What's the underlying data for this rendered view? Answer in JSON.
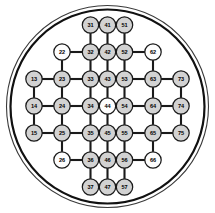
{
  "figure": {
    "type": "node-link-diagram",
    "width": 215,
    "height": 213,
    "background_color": "#ffffff"
  },
  "wafer": {
    "name": "wafer-boundary",
    "center_x": 107.5,
    "center_y": 106.5,
    "outer_radius": 101,
    "inner_radius": 97,
    "outer_stroke_color": "#3a3a3a",
    "inner_stroke_color": "#111111"
  },
  "style": {
    "node_fill_gray": "#d2d2d2",
    "node_fill_white": "#fdfdfd",
    "node_stroke": "#1a1a1a",
    "edge_color": "#1a1a1a",
    "label_color": "#000000",
    "node_radius": 8.2
  },
  "graph_data": {
    "type": "node-link",
    "node_count": 37,
    "edge_count": 84,
    "row_count": 7,
    "column_count": 7,
    "rows": [
      {
        "index": 1,
        "y": 25,
        "labels": [
          "31",
          "41",
          "51"
        ]
      },
      {
        "index": 2,
        "y": 52,
        "labels": [
          "22",
          "32",
          "42",
          "52",
          "62"
        ]
      },
      {
        "index": 3,
        "y": 79,
        "labels": [
          "13",
          "23",
          "33",
          "43",
          "53",
          "63",
          "73"
        ]
      },
      {
        "index": 4,
        "y": 106,
        "labels": [
          "14",
          "24",
          "34",
          "44",
          "54",
          "64",
          "74"
        ]
      },
      {
        "index": 5,
        "y": 133,
        "labels": [
          "15",
          "25",
          "35",
          "45",
          "55",
          "65",
          "75"
        ]
      },
      {
        "index": 6,
        "y": 160,
        "labels": [
          "26",
          "36",
          "46",
          "56",
          "66"
        ]
      },
      {
        "index": 7,
        "y": 187,
        "labels": [
          "37",
          "47",
          "57"
        ]
      }
    ],
    "nodes": [
      {
        "id": "31",
        "label": "31",
        "x": 90.5,
        "y": 25,
        "fill": "gray"
      },
      {
        "id": "41",
        "label": "41",
        "x": 107.5,
        "y": 25,
        "fill": "gray"
      },
      {
        "id": "51",
        "label": "51",
        "x": 124.5,
        "y": 25,
        "fill": "gray"
      },
      {
        "id": "22",
        "label": "22",
        "x": 62.0,
        "y": 52,
        "fill": "white"
      },
      {
        "id": "32",
        "label": "32",
        "x": 90.5,
        "y": 52,
        "fill": "gray"
      },
      {
        "id": "42",
        "label": "42",
        "x": 107.5,
        "y": 52,
        "fill": "gray"
      },
      {
        "id": "52",
        "label": "52",
        "x": 124.5,
        "y": 52,
        "fill": "gray"
      },
      {
        "id": "62",
        "label": "62",
        "x": 153.0,
        "y": 52,
        "fill": "white"
      },
      {
        "id": "13",
        "label": "13",
        "x": 34.0,
        "y": 79,
        "fill": "gray"
      },
      {
        "id": "23",
        "label": "23",
        "x": 62.0,
        "y": 79,
        "fill": "gray"
      },
      {
        "id": "33",
        "label": "33",
        "x": 90.5,
        "y": 79,
        "fill": "gray"
      },
      {
        "id": "43",
        "label": "43",
        "x": 107.5,
        "y": 79,
        "fill": "gray"
      },
      {
        "id": "53",
        "label": "53",
        "x": 124.5,
        "y": 79,
        "fill": "gray"
      },
      {
        "id": "63",
        "label": "63",
        "x": 153.0,
        "y": 79,
        "fill": "gray"
      },
      {
        "id": "73",
        "label": "73",
        "x": 181.0,
        "y": 79,
        "fill": "gray"
      },
      {
        "id": "14",
        "label": "14",
        "x": 34.0,
        "y": 106,
        "fill": "gray"
      },
      {
        "id": "24",
        "label": "24",
        "x": 62.0,
        "y": 106,
        "fill": "gray"
      },
      {
        "id": "34",
        "label": "34",
        "x": 90.5,
        "y": 106,
        "fill": "gray"
      },
      {
        "id": "44",
        "label": "44",
        "x": 107.5,
        "y": 106,
        "fill": "white"
      },
      {
        "id": "54",
        "label": "54",
        "x": 124.5,
        "y": 106,
        "fill": "gray"
      },
      {
        "id": "64",
        "label": "64",
        "x": 153.0,
        "y": 106,
        "fill": "gray"
      },
      {
        "id": "74",
        "label": "74",
        "x": 181.0,
        "y": 106,
        "fill": "gray"
      },
      {
        "id": "15",
        "label": "15",
        "x": 34.0,
        "y": 133,
        "fill": "gray"
      },
      {
        "id": "25",
        "label": "25",
        "x": 62.0,
        "y": 133,
        "fill": "gray"
      },
      {
        "id": "35",
        "label": "35",
        "x": 90.5,
        "y": 133,
        "fill": "gray"
      },
      {
        "id": "45",
        "label": "45",
        "x": 107.5,
        "y": 133,
        "fill": "gray"
      },
      {
        "id": "55",
        "label": "55",
        "x": 124.5,
        "y": 133,
        "fill": "gray"
      },
      {
        "id": "65",
        "label": "65",
        "x": 153.0,
        "y": 133,
        "fill": "gray"
      },
      {
        "id": "75",
        "label": "75",
        "x": 181.0,
        "y": 133,
        "fill": "gray"
      },
      {
        "id": "26",
        "label": "26",
        "x": 62.0,
        "y": 160,
        "fill": "white"
      },
      {
        "id": "36",
        "label": "36",
        "x": 90.5,
        "y": 160,
        "fill": "gray"
      },
      {
        "id": "46",
        "label": "46",
        "x": 107.5,
        "y": 160,
        "fill": "gray"
      },
      {
        "id": "56",
        "label": "56",
        "x": 124.5,
        "y": 160,
        "fill": "gray"
      },
      {
        "id": "66",
        "label": "66",
        "x": 153.0,
        "y": 160,
        "fill": "white"
      },
      {
        "id": "37",
        "label": "37",
        "x": 90.5,
        "y": 187,
        "fill": "gray"
      },
      {
        "id": "47",
        "label": "47",
        "x": 107.5,
        "y": 187,
        "fill": "gray"
      },
      {
        "id": "57",
        "label": "57",
        "x": 124.5,
        "y": 187,
        "fill": "gray"
      }
    ],
    "edges": [
      [
        "31",
        "41"
      ],
      [
        "41",
        "51"
      ],
      [
        "22",
        "32"
      ],
      [
        "32",
        "42"
      ],
      [
        "42",
        "52"
      ],
      [
        "52",
        "62"
      ],
      [
        "13",
        "23"
      ],
      [
        "23",
        "33"
      ],
      [
        "33",
        "43"
      ],
      [
        "43",
        "53"
      ],
      [
        "53",
        "63"
      ],
      [
        "63",
        "73"
      ],
      [
        "14",
        "24"
      ],
      [
        "24",
        "34"
      ],
      [
        "34",
        "44"
      ],
      [
        "44",
        "54"
      ],
      [
        "54",
        "64"
      ],
      [
        "64",
        "74"
      ],
      [
        "15",
        "25"
      ],
      [
        "25",
        "35"
      ],
      [
        "35",
        "45"
      ],
      [
        "45",
        "55"
      ],
      [
        "55",
        "65"
      ],
      [
        "65",
        "75"
      ],
      [
        "26",
        "36"
      ],
      [
        "36",
        "46"
      ],
      [
        "46",
        "56"
      ],
      [
        "56",
        "66"
      ],
      [
        "37",
        "47"
      ],
      [
        "47",
        "57"
      ],
      [
        "31",
        "32"
      ],
      [
        "41",
        "42"
      ],
      [
        "51",
        "52"
      ],
      [
        "22",
        "23"
      ],
      [
        "32",
        "33"
      ],
      [
        "42",
        "43"
      ],
      [
        "52",
        "53"
      ],
      [
        "62",
        "63"
      ],
      [
        "13",
        "14"
      ],
      [
        "23",
        "24"
      ],
      [
        "33",
        "34"
      ],
      [
        "43",
        "44"
      ],
      [
        "53",
        "54"
      ],
      [
        "63",
        "64"
      ],
      [
        "73",
        "74"
      ],
      [
        "14",
        "15"
      ],
      [
        "24",
        "25"
      ],
      [
        "34",
        "35"
      ],
      [
        "44",
        "45"
      ],
      [
        "54",
        "55"
      ],
      [
        "64",
        "65"
      ],
      [
        "74",
        "75"
      ],
      [
        "25",
        "26"
      ],
      [
        "35",
        "36"
      ],
      [
        "45",
        "46"
      ],
      [
        "55",
        "56"
      ],
      [
        "65",
        "66"
      ],
      [
        "36",
        "37"
      ],
      [
        "46",
        "47"
      ],
      [
        "56",
        "57"
      ]
    ]
  }
}
